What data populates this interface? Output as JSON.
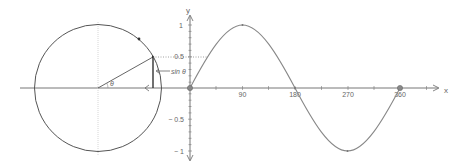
{
  "diagram": {
    "circle": {
      "angle_label": "θ",
      "sine_label": "sin θ",
      "angle_deg": 30
    },
    "graph": {
      "x_axis_label": "x",
      "y_axis_label": "y",
      "x_ticks": [
        "90",
        "180",
        "270",
        "360"
      ],
      "y_ticks": [
        "1",
        "0.5",
        "− 0.5",
        "− 1"
      ]
    },
    "colors": {
      "curve": "#888888",
      "axis": "#777777",
      "circle": "#555555",
      "point": "#888888"
    }
  }
}
